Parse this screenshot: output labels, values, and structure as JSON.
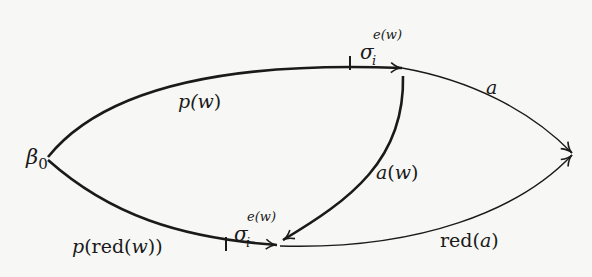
{
  "diagram": {
    "type": "commutative-diagram",
    "nodes": {
      "start": {
        "label": "β",
        "subscript": "0"
      }
    },
    "edges": [
      {
        "id": "p_w",
        "from": "start",
        "to": "top",
        "label_main": "p(",
        "label_var": "w",
        "label_close": ")"
      },
      {
        "id": "sigma_top",
        "from": "top-tick",
        "to": "top",
        "symbol": "σ",
        "sub": "i",
        "sup": "e(w)"
      },
      {
        "id": "a",
        "from": "top",
        "to": "right",
        "label": "a"
      },
      {
        "id": "a_w",
        "from": "top",
        "to": "bottom",
        "label_var": "a",
        "label_open": "(",
        "label_arg": "w",
        "label_close": ")"
      },
      {
        "id": "p_red_w",
        "from": "start",
        "to": "bottom",
        "label_p": "p",
        "label_mid": "(red(",
        "label_var": "w",
        "label_close": "))"
      },
      {
        "id": "sigma_bottom",
        "from": "bottom-tick",
        "to": "bottom",
        "symbol": "σ",
        "sub": "i",
        "sup": "e(w)"
      },
      {
        "id": "red_a",
        "from": "bottom",
        "to": "right",
        "label_red": "red(",
        "label_var": "a",
        "label_close": ")"
      }
    ],
    "colors": {
      "stroke": "#1a1a1a",
      "background": "#f7f7f5"
    }
  }
}
